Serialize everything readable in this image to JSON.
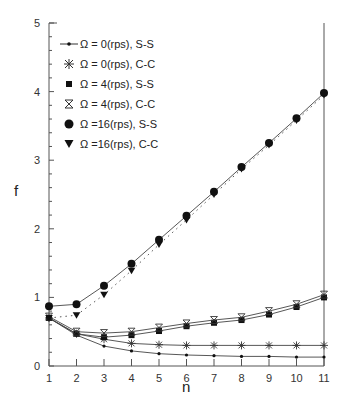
{
  "chart_data": {
    "type": "line",
    "title": "",
    "xlabel": "n",
    "ylabel": "f",
    "xlim": [
      1,
      11
    ],
    "ylim": [
      0,
      5
    ],
    "x": [
      1,
      2,
      3,
      4,
      5,
      6,
      7,
      8,
      9,
      10,
      11
    ],
    "x_ticks": [
      "1",
      "2",
      "3",
      "4",
      "5",
      "6",
      "7",
      "8",
      "9",
      "10",
      "11"
    ],
    "y_ticks": [
      "0",
      "1",
      "2",
      "3",
      "4",
      "5"
    ],
    "grid": false,
    "legend_position": "upper-left",
    "series": [
      {
        "name": "Ω = 0(rps), S-S",
        "marker": "dot",
        "line": "solid",
        "values": [
          0.7,
          0.45,
          0.29,
          0.22,
          0.18,
          0.16,
          0.15,
          0.14,
          0.14,
          0.13,
          0.13
        ]
      },
      {
        "name": "Ω = 0(rps), C-C",
        "marker": "asterisk",
        "line": "solid",
        "values": [
          0.7,
          0.47,
          0.39,
          0.33,
          0.31,
          0.3,
          0.3,
          0.3,
          0.3,
          0.3,
          0.3
        ]
      },
      {
        "name": "Ω = 4(rps), S-S",
        "marker": "square",
        "line": "solid",
        "values": [
          0.7,
          0.47,
          0.42,
          0.45,
          0.51,
          0.58,
          0.63,
          0.67,
          0.75,
          0.86,
          1.0
        ]
      },
      {
        "name": "Ω = 4(rps), C-C",
        "marker": "hourglass",
        "line": "solid",
        "values": [
          0.72,
          0.5,
          0.48,
          0.5,
          0.56,
          0.62,
          0.67,
          0.71,
          0.8,
          0.9,
          1.04
        ]
      },
      {
        "name": "Ω = 16(rps), S-S",
        "marker": "circle",
        "line": "solid",
        "values": [
          0.87,
          0.9,
          1.17,
          1.49,
          1.84,
          2.19,
          2.54,
          2.9,
          3.25,
          3.61,
          3.98
        ]
      },
      {
        "name": "Ω = 16(rps), C-C",
        "marker": "triangle-down",
        "line": "dotted",
        "values": [
          0.7,
          0.74,
          1.04,
          1.39,
          1.77,
          2.13,
          2.5,
          2.87,
          3.22,
          3.58,
          3.95
        ]
      }
    ]
  },
  "legend": [
    {
      "label": "Ω = 0(rps),  S-S"
    },
    {
      "label": "Ω = 0(rps),  C-C"
    },
    {
      "label": "Ω = 4(rps),  S-S"
    },
    {
      "label": "Ω = 4(rps),  C-C"
    },
    {
      "label": "Ω =16(rps),  S-S"
    },
    {
      "label": "Ω =16(rps),  C-C"
    }
  ],
  "axis": {
    "x_label": "n",
    "y_label": "f"
  }
}
